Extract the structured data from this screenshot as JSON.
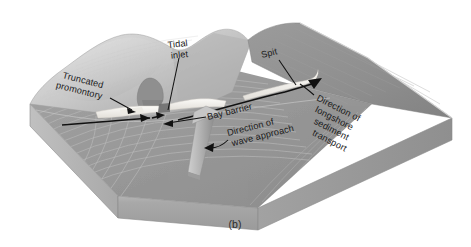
{
  "figure": {
    "caption": "(b)",
    "type": "block-diagram"
  },
  "labels": {
    "truncated_promontory": {
      "line1": "Truncated",
      "line2": "promontory"
    },
    "tidal_inlet": {
      "line1": "Tidal",
      "line2": "inlet"
    },
    "spit": {
      "line1": "Spit"
    },
    "bay_barrier": {
      "line1": "Bay barrier"
    },
    "longshore_transport": {
      "line1": "Direction of",
      "line2": "longshore",
      "line3": "sediment",
      "line4": "transport"
    },
    "wave_approach": {
      "line1": "Direction of",
      "line2": "wave approach"
    }
  },
  "colors": {
    "ocean": "#9a9a9a",
    "ocean_dark": "#8a8a8a",
    "land_light": "#d2d2d2",
    "land_mid": "#b9b9b9",
    "land_shadow": "#9f9f9f",
    "bay_dark": "#8d8d8d",
    "block_front": "#a5a5a5",
    "block_side": "#b0b0b0",
    "beach_white": "#f4f2ee",
    "promontory": "#8f8f8f",
    "arrow_gray": "#b5b5b5",
    "line_black": "#111111",
    "background": "#ffffff"
  }
}
